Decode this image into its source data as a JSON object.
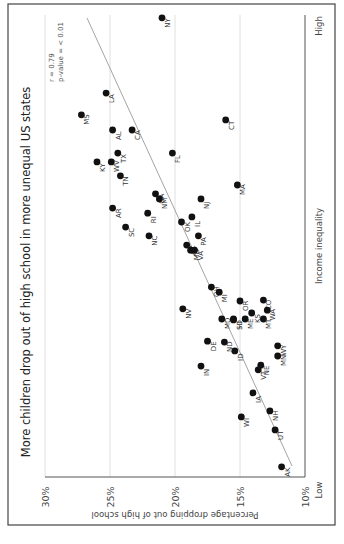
{
  "chart_data": {
    "type": "scatter",
    "orientation_note": "figure rotated 90 degrees clockwise",
    "title": "More children drop out of high school in more unequal US states",
    "xlabel": "Income inequality",
    "x_tick_labels": [
      "Low",
      "High"
    ],
    "ylabel": "Percentage dropping out of high school",
    "y_tick_labels": [
      "10%",
      "15%",
      "20%",
      "25%",
      "30%"
    ],
    "ylim": [
      10,
      30
    ],
    "xlim": [
      0,
      100
    ],
    "grid": true,
    "annotations": [
      "r = 0.79",
      "p-value = < 0.01"
    ],
    "trend_line": {
      "x": [
        0,
        100
      ],
      "y": [
        11.5,
        28.0
      ]
    },
    "points": [
      {
        "state": "NY",
        "inequality": 99.4,
        "dropout": 21.0
      },
      {
        "state": "LA",
        "inequality": 83.1,
        "dropout": 25.3
      },
      {
        "state": "MS",
        "inequality": 78.4,
        "dropout": 27.2
      },
      {
        "state": "CT",
        "inequality": 77.3,
        "dropout": 16.1
      },
      {
        "state": "AL",
        "inequality": 75.1,
        "dropout": 24.8
      },
      {
        "state": "CA",
        "inequality": 75.1,
        "dropout": 23.3
      },
      {
        "state": "TX",
        "inequality": 70.1,
        "dropout": 24.4
      },
      {
        "state": "FL",
        "inequality": 70.1,
        "dropout": 20.2
      },
      {
        "state": "KY",
        "inequality": 68.2,
        "dropout": 26.0
      },
      {
        "state": "WV",
        "inequality": 68.2,
        "dropout": 24.9
      },
      {
        "state": "TN",
        "inequality": 65.2,
        "dropout": 24.2
      },
      {
        "state": "MA",
        "inequality": 63.2,
        "dropout": 15.2
      },
      {
        "state": "GA",
        "inequality": 61.3,
        "dropout": 21.5
      },
      {
        "state": "NM",
        "inequality": 60.2,
        "dropout": 21.2
      },
      {
        "state": "NJ",
        "inequality": 60.2,
        "dropout": 18.0
      },
      {
        "state": "AR",
        "inequality": 58.2,
        "dropout": 24.8
      },
      {
        "state": "RI",
        "inequality": 57.1,
        "dropout": 22.1
      },
      {
        "state": "IL",
        "inequality": 56.3,
        "dropout": 18.7
      },
      {
        "state": "OK",
        "inequality": 55.2,
        "dropout": 19.5
      },
      {
        "state": "SC",
        "inequality": 54.1,
        "dropout": 23.8
      },
      {
        "state": "NC",
        "inequality": 52.2,
        "dropout": 22.0
      },
      {
        "state": "PA",
        "inequality": 52.2,
        "dropout": 18.2
      },
      {
        "state": "AZ",
        "inequality": 50.2,
        "dropout": 19.1
      },
      {
        "state": "MO",
        "inequality": 49.1,
        "dropout": 18.8
      },
      {
        "state": "VA",
        "inequality": 49.1,
        "dropout": 18.5
      },
      {
        "state": "OH",
        "inequality": 41.1,
        "dropout": 17.2
      },
      {
        "state": "MI",
        "inequality": 40.0,
        "dropout": 16.6
      },
      {
        "state": "CO",
        "inequality": 38.3,
        "dropout": 13.2
      },
      {
        "state": "OR",
        "inequality": 38.1,
        "dropout": 15.0
      },
      {
        "state": "NV",
        "inequality": 36.4,
        "dropout": 19.4
      },
      {
        "state": "WA",
        "inequality": 36.1,
        "dropout": 12.9
      },
      {
        "state": "KS",
        "inequality": 35.5,
        "dropout": 14.1
      },
      {
        "state": "MD",
        "inequality": 34.2,
        "dropout": 16.4
      },
      {
        "state": "HI",
        "inequality": 34.2,
        "dropout": 15.5
      },
      {
        "state": "ME",
        "inequality": 34.2,
        "dropout": 14.6
      },
      {
        "state": "MT",
        "inequality": 34.2,
        "dropout": 13.2
      },
      {
        "state": "SD",
        "inequality": 34.0,
        "dropout": 15.5
      },
      {
        "state": "DE",
        "inequality": 29.4,
        "dropout": 17.5
      },
      {
        "state": "ND",
        "inequality": 29.2,
        "dropout": 16.2
      },
      {
        "state": "WY",
        "inequality": 28.4,
        "dropout": 12.1
      },
      {
        "state": "ID",
        "inequality": 27.3,
        "dropout": 15.4
      },
      {
        "state": "MN",
        "inequality": 26.2,
        "dropout": 12.1
      },
      {
        "state": "NE",
        "inequality": 24.2,
        "dropout": 13.4
      },
      {
        "state": "IN",
        "inequality": 24.0,
        "dropout": 18.0
      },
      {
        "state": "VT",
        "inequality": 23.2,
        "dropout": 13.6
      },
      {
        "state": "IA",
        "inequality": 18.2,
        "dropout": 14.0
      },
      {
        "state": "NH",
        "inequality": 14.3,
        "dropout": 12.7
      },
      {
        "state": "WI",
        "inequality": 13.0,
        "dropout": 14.9
      },
      {
        "state": "UT",
        "inequality": 10.2,
        "dropout": 12.3
      },
      {
        "state": "AK",
        "inequality": 2.2,
        "dropout": 11.8
      }
    ]
  },
  "colors": {
    "point": "#111111",
    "trend_line": "#9a9a9a",
    "grid": "#d8d8d8",
    "axis": "#555555",
    "frame": "#444444"
  }
}
